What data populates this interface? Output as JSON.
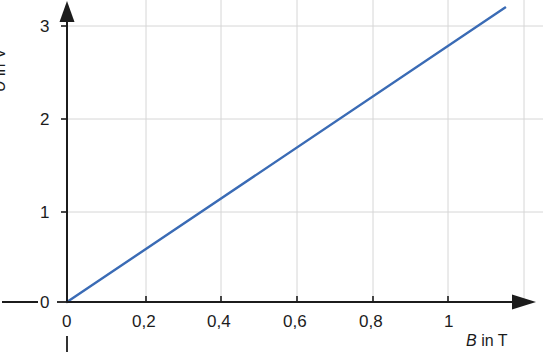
{
  "chart_data": {
    "type": "line",
    "title": "",
    "subtitle": "",
    "xlabel_symbol": "B",
    "xlabel_unit": "T",
    "xlabel": "B in T",
    "ylabel_symbol": "U",
    "ylabel_unit": "V",
    "ylabel": "U in V",
    "xlim": [
      0,
      1.15
    ],
    "ylim": [
      0,
      3.2
    ],
    "xticks": [
      0,
      0.2,
      0.4,
      0.6,
      0.8,
      1
    ],
    "xtick_labels": [
      "0",
      "0,2",
      "0,4",
      "0,6",
      "0,8",
      "1"
    ],
    "yticks": [
      0,
      1,
      2,
      3
    ],
    "ytick_labels": [
      "0",
      "1",
      "2",
      "3"
    ],
    "grid": true,
    "grid_color": "#d6d6d6",
    "legend": null,
    "legend_position": "none",
    "axis_color": "#1c1c1c",
    "series": [
      {
        "name": "U(B)",
        "color": "#3a6bb5",
        "linewidth": 2.4,
        "slope": 2.78,
        "intercept": 0,
        "x": [
          0,
          0.2,
          0.4,
          0.6,
          0.8,
          1.0,
          1.15
        ],
        "values": [
          0,
          0.556,
          1.111,
          1.667,
          2.222,
          2.778,
          3.2
        ]
      }
    ],
    "annotations": [
      {
        "name": "origin-left-dash",
        "text": ""
      },
      {
        "name": "origin-bottom-tick",
        "text": ""
      }
    ]
  },
  "axes": {
    "y_tick_0": "0",
    "y_tick_1": "1",
    "y_tick_2": "2",
    "y_tick_3": "3",
    "x_tick_0": "0",
    "x_tick_1": "0,2",
    "x_tick_2": "0,4",
    "x_tick_3": "0,6",
    "x_tick_4": "0,8",
    "x_tick_5": "1",
    "x_title_symbol": "B",
    "x_title_mid": "in",
    "x_title_unit": "T",
    "y_title_symbol": "U",
    "y_title_mid": "in",
    "y_title_unit": "V"
  }
}
